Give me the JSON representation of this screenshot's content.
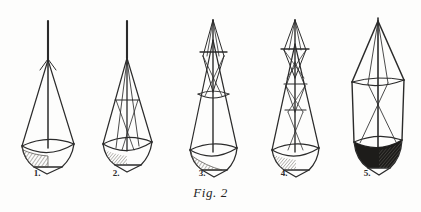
{
  "plate": {
    "caption": "Fig. 2",
    "background_color": "#fdfdfc",
    "ink_color": "#2b2b2b",
    "width": 421,
    "height": 212
  },
  "figures": [
    {
      "label": "1.",
      "label_x": 37,
      "label_y": 168,
      "center_x": 48,
      "description": "plain conical tow net with single vertical rod, open rim and hatched bag bottom"
    },
    {
      "label": "2.",
      "label_x": 116,
      "label_y": 168,
      "center_x": 127,
      "description": "conical net with inner cone bridle and one horizontal cross-bar"
    },
    {
      "label": "3.",
      "label_x": 202,
      "label_y": 168,
      "center_x": 213,
      "description": "conical net with elongated upper lens bridle, cross-bar and intermediate ring"
    },
    {
      "label": "4.",
      "label_x": 284,
      "label_y": 168,
      "center_x": 295,
      "description": "conical net with two stacked lens bridles and three cross-bars"
    },
    {
      "label": "5.",
      "label_x": 367,
      "label_y": 168,
      "center_x": 378,
      "description": "cylindrical net with conical top, straight side walls and dark filled bucket"
    }
  ],
  "colors": {
    "ink": "#2b2b2b",
    "ink_light": "#55534f",
    "hatch": "#6b6862",
    "fill_dark": "#1d1c1a",
    "paper": "#fdfdfc"
  }
}
